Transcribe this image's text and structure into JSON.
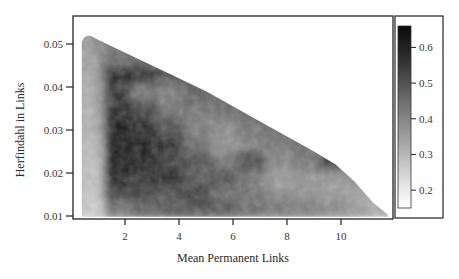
{
  "chart_data": {
    "type": "heatmap",
    "title": "",
    "xlabel": "Mean Permanent Links",
    "ylabel": "Herfindahl in Links",
    "xlim": [
      0.1,
      11.9
    ],
    "ylim": [
      0.0095,
      0.0562
    ],
    "x_ticks": [
      2,
      4,
      6,
      8,
      10
    ],
    "x_tick_labels": [
      "2",
      "4",
      "6",
      "8",
      "10"
    ],
    "y_ticks": [
      0.01,
      0.02,
      0.03,
      0.04,
      0.05
    ],
    "y_tick_labels": [
      "0.01",
      "0.02",
      "0.03",
      "0.04",
      "0.05"
    ],
    "grid": false,
    "colorbar": {
      "position": "right",
      "range": [
        0.15,
        0.66
      ],
      "ticks": [
        0.2,
        0.3,
        0.4,
        0.5,
        0.6
      ],
      "tick_labels": [
        "0.2",
        "0.3",
        "0.4",
        "0.5",
        "0.6"
      ],
      "colormap": "white-to-black grayscale (higher value = darker)"
    },
    "data_region_boundary": {
      "description": "Valid region lies below a diagonal upper boundary; white outside",
      "upper_boundary_points": [
        [
          0.4,
          0.052
        ],
        [
          1.0,
          0.051
        ],
        [
          3.0,
          0.045
        ],
        [
          5.0,
          0.039
        ],
        [
          7.0,
          0.032
        ],
        [
          9.0,
          0.025
        ],
        [
          9.8,
          0.022
        ],
        [
          10.5,
          0.018
        ],
        [
          11.2,
          0.013
        ],
        [
          11.7,
          0.0105
        ]
      ],
      "lower_edge_y": 0.0105,
      "left_edge_x": 0.4
    },
    "x_centers": [
      0.75,
      1.75,
      2.75,
      3.75,
      4.75,
      5.75,
      6.75,
      7.75,
      8.75,
      9.75,
      10.75,
      11.5
    ],
    "y_centers": [
      0.0505,
      0.0465,
      0.0425,
      0.0385,
      0.0345,
      0.0305,
      0.0265,
      0.0225,
      0.0185,
      0.0145,
      0.0115
    ],
    "z_values": [
      [
        0.4,
        0.42,
        null,
        null,
        null,
        null,
        null,
        null,
        null,
        null,
        null,
        null
      ],
      [
        0.38,
        0.46,
        0.47,
        0.46,
        null,
        null,
        null,
        null,
        null,
        null,
        null,
        null
      ],
      [
        0.36,
        0.6,
        0.6,
        0.52,
        0.48,
        0.47,
        null,
        null,
        null,
        null,
        null,
        null
      ],
      [
        0.34,
        0.58,
        0.44,
        0.42,
        0.5,
        0.47,
        0.46,
        null,
        null,
        null,
        null,
        null
      ],
      [
        0.33,
        0.6,
        0.55,
        0.45,
        0.44,
        0.46,
        0.47,
        0.46,
        null,
        null,
        null,
        null
      ],
      [
        0.32,
        0.63,
        0.6,
        0.52,
        0.42,
        0.4,
        0.45,
        0.46,
        0.47,
        null,
        null,
        null
      ],
      [
        0.3,
        0.64,
        0.62,
        0.58,
        0.46,
        0.38,
        0.42,
        0.44,
        0.46,
        0.46,
        null,
        null
      ],
      [
        0.28,
        0.63,
        0.62,
        0.56,
        0.52,
        0.45,
        0.55,
        0.4,
        0.44,
        0.56,
        0.42,
        null
      ],
      [
        0.27,
        0.62,
        0.58,
        0.6,
        0.5,
        0.52,
        0.44,
        0.36,
        0.38,
        0.37,
        0.38,
        null
      ],
      [
        0.26,
        0.55,
        0.56,
        0.52,
        0.58,
        0.46,
        0.45,
        0.4,
        0.38,
        0.36,
        0.34,
        0.3
      ],
      [
        0.24,
        0.45,
        0.48,
        0.5,
        0.52,
        0.5,
        0.46,
        0.44,
        0.42,
        0.4,
        0.36,
        0.32
      ]
    ]
  },
  "plot": {
    "left": 73,
    "top": 16,
    "right": 393,
    "bottom": 219,
    "x_px_per_unit": 27.0,
    "x_origin_px": 71,
    "y_px_per_unit": 4300,
    "y_origin_value": 0.01,
    "y_origin_px": 216
  },
  "colorbar_box": {
    "left": 395,
    "top": 16,
    "right": 443,
    "bottom": 218
  },
  "colorbar_bar": {
    "left": 398,
    "top": 26,
    "right": 411,
    "bottom": 208
  },
  "labels": {
    "xlabel": "Mean Permanent Links",
    "ylabel": "Herfindahl in Links"
  }
}
